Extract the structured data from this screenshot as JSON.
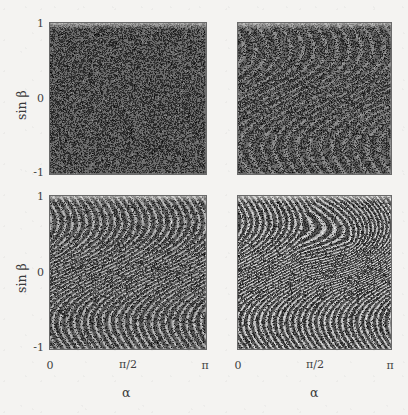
{
  "figure": {
    "background_color": "#f4f3f1",
    "ink_color": "#3a3a3a",
    "point_color": "#2e2e2e",
    "panel_fill_color": "#6d6d6d",
    "layout": "2x2 grid of phase-space scatter panels"
  },
  "axes": {
    "x_label": "α",
    "y_label": "sin β",
    "x_ticks": [
      "0",
      "π/2",
      "π"
    ],
    "x_tick_values": [
      0,
      1.5707963,
      3.1415927
    ],
    "y_ticks": [
      "1",
      "0",
      "-1"
    ],
    "y_tick_values": [
      1,
      0,
      -1
    ]
  },
  "chart_data": {
    "type": "scatter",
    "title": "",
    "xlabel": "α",
    "ylabel": "sin β",
    "xlim": [
      0,
      3.1415927
    ],
    "ylim": [
      -1,
      1
    ],
    "xtick_labels": [
      "0",
      "π/2",
      "π"
    ],
    "ytick_labels": [
      "1",
      "0",
      "-1"
    ],
    "grid": false,
    "legend": "none",
    "panel_grid": {
      "rows": 2,
      "cols": 2
    },
    "panels": [
      {
        "id": "panel-top-left",
        "row": 0,
        "col": 0,
        "regime": "fully chaotic",
        "structure": "uniform random point cloud, no visible filaments",
        "n_points": 26000,
        "filament_strength": 0.0,
        "filament_count": 0,
        "density": 0.58,
        "show_x_ticks": false,
        "show_y_ticks": true
      },
      {
        "id": "panel-top-right",
        "row": 0,
        "col": 1,
        "regime": "weakly structured",
        "structure": "faint diagonal striations emerging from noise",
        "n_points": 24000,
        "filament_strength": 0.34,
        "filament_count": 13,
        "density": 0.55,
        "show_x_ticks": false,
        "show_y_ticks": false
      },
      {
        "id": "panel-bottom-left",
        "row": 1,
        "col": 0,
        "regime": "strongly filamented",
        "structure": "pronounced S-shaped filament bundles spanning the section",
        "n_points": 23000,
        "filament_strength": 0.72,
        "filament_count": 22,
        "density": 0.52,
        "show_x_ticks": true,
        "show_y_ticks": true
      },
      {
        "id": "panel-bottom-right",
        "row": 1,
        "col": 1,
        "regime": "sharply filamented with folded island",
        "structure": "dense sigmoid filaments with a folded recirculation region at upper right",
        "n_points": 23000,
        "filament_strength": 0.92,
        "filament_count": 26,
        "density": 0.5,
        "show_x_ticks": true,
        "show_y_ticks": false
      }
    ]
  }
}
